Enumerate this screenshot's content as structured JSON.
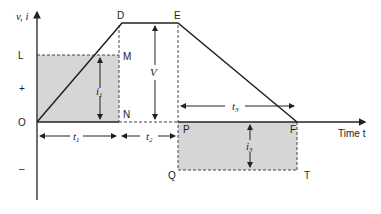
{
  "diagram": {
    "y_axis_label": "v, i",
    "x_axis_label": "Time t",
    "levels": {
      "L": "L",
      "plus": "+",
      "O": "O",
      "minus": "–"
    },
    "points": {
      "D": "D",
      "E": "E",
      "M": "M",
      "N": "N",
      "P": "P",
      "F": "F",
      "Q": "Q",
      "T": "T"
    },
    "quantities": {
      "V": "V",
      "i1": "i",
      "i1_sub": "1",
      "i3": "i",
      "i3_sub": "3"
    },
    "intervals": {
      "t1": "t",
      "t1_sub": "1",
      "t2": "t",
      "t2_sub": "2",
      "t3": "t",
      "t3_sub": "3"
    },
    "colors": {
      "shade": "#d6d6d6",
      "line": "#222222"
    }
  }
}
